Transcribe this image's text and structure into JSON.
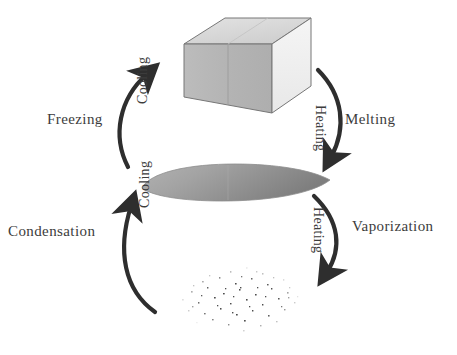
{
  "diagram": {
    "background_color": "#ffffff",
    "text_color": "#3c3c3c",
    "arrow_color": "#2e2e2e",
    "states": [
      {
        "id": "solid",
        "name": "Solid",
        "shape": "rectangular-block",
        "colors": {
          "top_face": "#d9d9d9",
          "front_face": "#b6b6b6",
          "right_face": "#f1f1f1",
          "outline": "#6e6e6e"
        }
      },
      {
        "id": "liquid",
        "name": "Liquid",
        "shape": "lens-puddle",
        "colors": {
          "fill_light": "#a8a8a8",
          "fill_dark": "#868686",
          "outline": "#8a8a8a"
        }
      },
      {
        "id": "gas",
        "name": "Gas",
        "shape": "particle-cloud",
        "colors": {
          "particle": "#4a4a4a"
        }
      }
    ],
    "transitions": [
      {
        "id": "melting",
        "label": "Melting",
        "direction_label": "Heating",
        "from": "solid",
        "to": "liquid",
        "side": "right",
        "arrow_direction": "down"
      },
      {
        "id": "freezing",
        "label": "Freezing",
        "direction_label": "Cooling",
        "from": "liquid",
        "to": "solid",
        "side": "left",
        "arrow_direction": "up"
      },
      {
        "id": "vaporization",
        "label": "Vaporization",
        "direction_label": "Heating",
        "from": "liquid",
        "to": "gas",
        "side": "right",
        "arrow_direction": "down"
      },
      {
        "id": "condensation",
        "label": "Condensation",
        "direction_label": "Cooling",
        "from": "gas",
        "to": "liquid",
        "side": "left",
        "arrow_direction": "up"
      }
    ]
  }
}
